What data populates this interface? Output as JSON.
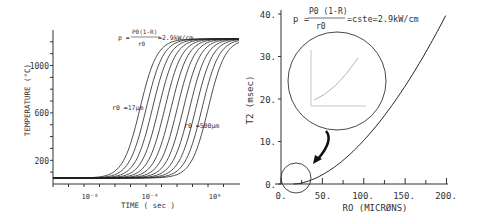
{
  "chart_data": [
    {
      "type": "line",
      "title": "",
      "annotation_formula": "p = P0(1-R)/r0 = 2.9kW/cm",
      "formula_left": "p =",
      "formula_num": "P0(1-R)",
      "formula_den": "r0",
      "formula_right": "=2.9kW/cm",
      "xlabel": "TIME ( sec )",
      "ylabel": "TEMPERATURE (°C)",
      "xscale": "log",
      "xticks": [
        "10⁻⁸",
        "10⁻⁴",
        "10⁰"
      ],
      "yticks": [
        200,
        600,
        1000
      ],
      "ylim": [
        0,
        1250
      ],
      "label_low": "r0 =17µm",
      "label_high": "r0 =500µm",
      "series_count": 12,
      "series_note": "Family of sigmoidal heating curves from r0 = 17 µm (left) to r0 = 500 µm (right), saturating near 1200 °C",
      "plateau": 1200
    },
    {
      "type": "line",
      "title": "",
      "formula_left": "p =",
      "formula_num": "P0 (1-R)",
      "formula_den": "r0",
      "formula_right": "=cste=2.9kW/cm",
      "xlabel": "RO (MICRØNS)",
      "ylabel": "T2 (msec)",
      "xticks": [
        "0.",
        "50.",
        "100.",
        "150.",
        "200."
      ],
      "yticks": [
        "0.",
        "10.",
        "20.",
        "30.",
        "40."
      ],
      "xlim": [
        0,
        200
      ],
      "ylim": [
        0,
        40
      ],
      "x": [
        15,
        25,
        50,
        75,
        100,
        125,
        150,
        175,
        200
      ],
      "y": [
        0,
        0.7,
        2.7,
        5.8,
        10.2,
        15.8,
        22.5,
        30.5,
        40
      ],
      "inset_note": "Magnified inset of the small-r0 region shown in circle, arrow pointing to origin circle"
    }
  ]
}
